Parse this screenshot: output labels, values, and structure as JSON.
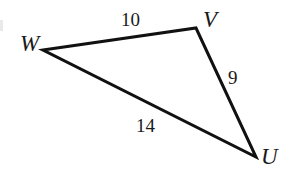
{
  "figure": {
    "type": "geometry-diagram",
    "shape": "triangle",
    "background_color": "#ffffff",
    "stroke_color": "#111111",
    "stroke_width": 3,
    "text_color": "#1a1a1a"
  },
  "vertices": [
    {
      "id": "W",
      "label": "W",
      "x": 43,
      "y": 50,
      "label_x": 20,
      "label_y": 32
    },
    {
      "id": "V",
      "label": "V",
      "x": 196,
      "y": 28,
      "label_x": 203,
      "label_y": 8
    },
    {
      "id": "U",
      "label": "U",
      "x": 256,
      "y": 157,
      "label_x": 261,
      "label_y": 145
    }
  ],
  "sides": [
    {
      "id": "WV",
      "from": "W",
      "to": "V",
      "length_label": "10",
      "label_x": 121,
      "label_y": 10
    },
    {
      "id": "VU",
      "from": "V",
      "to": "U",
      "length_label": "9",
      "label_x": 228,
      "label_y": 68
    },
    {
      "id": "WU",
      "from": "W",
      "to": "U",
      "length_label": "14",
      "label_x": 136,
      "label_y": 116
    }
  ],
  "artifact": {
    "name": "edge-scan-artifact",
    "color": "#e9e9e9"
  }
}
